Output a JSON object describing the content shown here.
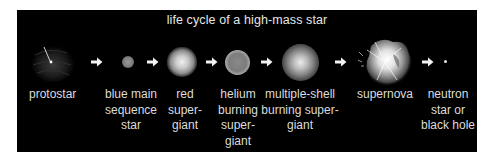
{
  "title": "life cycle of a high-mass star",
  "colors": {
    "background": "#000000",
    "text": "#dcdcdc",
    "page": "#ffffff"
  },
  "stages": [
    {
      "id": "protostar",
      "lines": [
        "protostar"
      ]
    },
    {
      "id": "blue-main-sequence-star",
      "lines": [
        "blue main",
        "sequence",
        "star"
      ]
    },
    {
      "id": "red-supergiant",
      "lines": [
        "red",
        "super-",
        "giant"
      ]
    },
    {
      "id": "helium-burning-supergiant",
      "lines": [
        "helium",
        "burning",
        "super-",
        "giant"
      ]
    },
    {
      "id": "multiple-shell-burning-supergiant",
      "lines": [
        "multiple-shell",
        "burning super-",
        "giant"
      ]
    },
    {
      "id": "supernova",
      "lines": [
        "supernova"
      ]
    },
    {
      "id": "neutron-star-or-black-hole",
      "lines": [
        "neutron",
        "star or",
        "black hole"
      ]
    }
  ],
  "arrow_icon": "right-arrow-icon"
}
